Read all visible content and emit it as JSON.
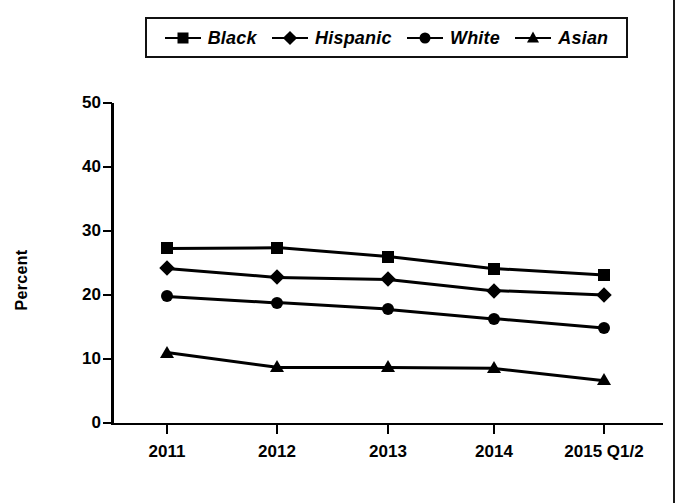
{
  "chart_data": {
    "type": "line",
    "title": "",
    "xlabel": "",
    "ylabel": "Percent",
    "categories": [
      "2011",
      "2012",
      "2013",
      "2014",
      "2015 Q1/2"
    ],
    "ylim": [
      0,
      50
    ],
    "yticks": [
      0,
      10,
      20,
      30,
      40,
      50
    ],
    "grid": false,
    "legend_position": "top",
    "series": [
      {
        "name": "Black",
        "marker": "square",
        "values": [
          27.3,
          27.4,
          26.0,
          24.1,
          23.1
        ]
      },
      {
        "name": "Hispanic",
        "marker": "diamond",
        "values": [
          24.2,
          22.8,
          22.5,
          20.7,
          20.0
        ]
      },
      {
        "name": "White",
        "marker": "circle",
        "values": [
          19.8,
          18.8,
          17.8,
          16.3,
          14.8
        ]
      },
      {
        "name": "Asian",
        "marker": "triangle",
        "values": [
          11.0,
          8.7,
          8.7,
          8.6,
          6.7
        ]
      }
    ]
  },
  "legend": {
    "items": [
      {
        "label": "Black",
        "marker": "square"
      },
      {
        "label": "Hispanic",
        "marker": "diamond"
      },
      {
        "label": "White",
        "marker": "circle"
      },
      {
        "label": "Asian",
        "marker": "triangle"
      }
    ]
  },
  "colors": {
    "ink": "#000000",
    "background": "#ffffff"
  }
}
